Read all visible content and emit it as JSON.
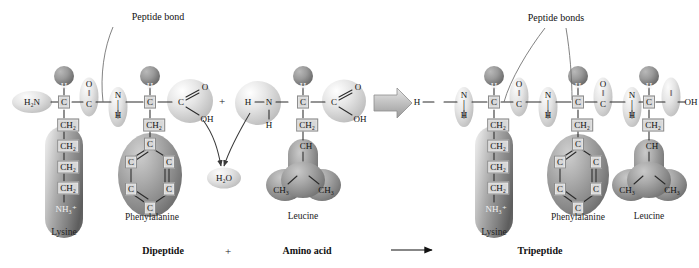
{
  "figure": {
    "type": "biochemistry-reaction-diagram"
  },
  "annotations": {
    "peptide_bond_singular": "Peptide bond",
    "peptide_bond_plural": "Peptide bonds",
    "water": "H₂O"
  },
  "equation": {
    "reactant1": "Dipeptide",
    "plus": "+",
    "reactant2": "Amino acid",
    "arrow": "⟶",
    "product": "Tripeptide",
    "middle_plus": "+"
  },
  "residue_names": {
    "lysine": "Lysine",
    "phenylalanine": "Phenylalanine",
    "leucine": "Leucine"
  },
  "atoms": {
    "h2n": "H₂N",
    "h": "H",
    "n": "N",
    "c": "C",
    "o": "O",
    "oh": "OH",
    "ch2": "CH₂",
    "ch": "CH",
    "ch3": "CH₃",
    "nh3plus": "NH₃⁺",
    "double_bond_vertical": "‖",
    "single_bond_vertical": "│"
  },
  "dipeptide": {
    "n_terminus": "H₂N",
    "residues": [
      {
        "name": "Lysine",
        "alpha_carbon": "C",
        "alpha_hydrogen": "H",
        "carbonyl_o": "O",
        "carbonyl_c": "C",
        "side_chain": [
          "CH₂",
          "CH₂",
          "CH₂",
          "CH₂",
          "NH₃⁺"
        ]
      },
      {
        "name": "Phenylalanine",
        "amide_n": "N",
        "amide_h": "H",
        "alpha_carbon": "C",
        "alpha_hydrogen": "H",
        "carboxyl_c": "C",
        "carboxyl_o": "O",
        "carboxyl_oh": "OH",
        "side_chain_first": "CH₂",
        "ring": [
          "C",
          "C",
          "C",
          "C",
          "C",
          "C"
        ]
      }
    ]
  },
  "amino_acid": {
    "name": "Leucine",
    "terminal_h": "H",
    "amino_n": "N",
    "amino_h": "H",
    "alpha_carbon": "C",
    "alpha_hydrogen": "H",
    "carboxyl_c": "C",
    "carboxyl_o": "O",
    "carboxyl_oh": "OH",
    "side_chain": {
      "beta": "CH₂",
      "gamma": "CH",
      "delta_left": "CH₃",
      "delta_right": "CH₃"
    }
  },
  "tripeptide": {
    "n_terminus_h": "H",
    "residues": [
      {
        "name": "Lysine",
        "amide_n": "N",
        "amide_h": "H",
        "alpha_carbon": "C",
        "alpha_hydrogen": "H",
        "carbonyl_o": "O",
        "carbonyl_c": "C",
        "side_chain": [
          "CH₂",
          "CH₂",
          "CH₂",
          "CH₂",
          "NH₃⁺"
        ]
      },
      {
        "name": "Phenylalanine",
        "amide_n": "N",
        "amide_h": "H",
        "alpha_carbon": "C",
        "alpha_hydrogen": "H",
        "carbonyl_o": "O",
        "carbonyl_c": "C",
        "side_chain_first": "CH₂",
        "ring": [
          "C",
          "C",
          "C",
          "C",
          "C",
          "C"
        ]
      },
      {
        "name": "Leucine",
        "amide_n": "N",
        "amide_h": "H",
        "alpha_carbon": "C",
        "alpha_hydrogen": "H",
        "carboxyl_o": "O",
        "carboxyl_c": "C",
        "c_terminus_oh": "OH",
        "side_chain": {
          "beta": "CH₂",
          "gamma": "CH",
          "delta_left": "CH₃",
          "delta_right": "CH₃"
        }
      }
    ]
  },
  "colors": {
    "background": "#ffffff",
    "atom_box_fill": "#d8d8d8",
    "atom_box_stroke": "#8d8d8d",
    "bond_stroke": "#2b2b2b",
    "leader_stroke": "#6b6b6b",
    "blob_dark": "#6f6f6f",
    "blob_light": "#d9d9d9",
    "reaction_arrow": "#b4b4b4",
    "text": "#1a1a1a"
  }
}
